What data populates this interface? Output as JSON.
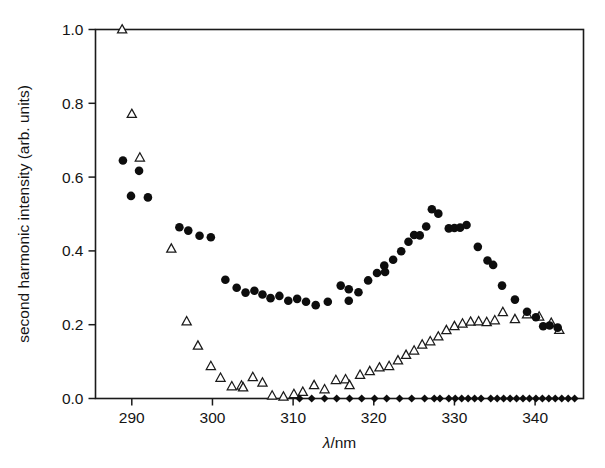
{
  "chart_data": {
    "type": "scatter",
    "title": "",
    "xlabel": "λ/nm",
    "ylabel": "second harmonic intensity (arb. units)",
    "xlim": [
      285.5,
      346
    ],
    "ylim": [
      0.0,
      1.0
    ],
    "xticks": [
      290,
      300,
      310,
      320,
      330,
      340
    ],
    "xticklabels": [
      "290",
      "300",
      "310",
      "320",
      "330",
      "340"
    ],
    "yticks": [
      0.0,
      0.2,
      0.4,
      0.6,
      0.8,
      1.0
    ],
    "yticklabels": [
      "0.0",
      "0.2",
      "0.4",
      "0.6",
      "0.8",
      "1.0"
    ],
    "grid": false,
    "legend": "none",
    "frame": "box",
    "series": [
      {
        "name": "second harmonic signal",
        "marker": "filled-circle",
        "color": "#0d0d0d",
        "points": [
          [
            288.9,
            0.645
          ],
          [
            289.9,
            0.549
          ],
          [
            290.9,
            0.617
          ],
          [
            292.0,
            0.545
          ],
          [
            295.9,
            0.464
          ],
          [
            297.0,
            0.455
          ],
          [
            298.4,
            0.441
          ],
          [
            299.8,
            0.437
          ],
          [
            301.6,
            0.322
          ],
          [
            303.0,
            0.3
          ],
          [
            304.1,
            0.287
          ],
          [
            305.2,
            0.292
          ],
          [
            306.2,
            0.282
          ],
          [
            307.2,
            0.272
          ],
          [
            308.3,
            0.278
          ],
          [
            309.4,
            0.265
          ],
          [
            310.5,
            0.27
          ],
          [
            311.6,
            0.262
          ],
          [
            312.8,
            0.253
          ],
          [
            314.3,
            0.262
          ],
          [
            315.9,
            0.306
          ],
          [
            316.9,
            0.296
          ],
          [
            316.9,
            0.265
          ],
          [
            318.1,
            0.288
          ],
          [
            319.3,
            0.32
          ],
          [
            320.4,
            0.34
          ],
          [
            321.3,
            0.36
          ],
          [
            321.4,
            0.343
          ],
          [
            322.4,
            0.376
          ],
          [
            323.4,
            0.399
          ],
          [
            324.3,
            0.425
          ],
          [
            325.0,
            0.443
          ],
          [
            325.7,
            0.442
          ],
          [
            326.5,
            0.466
          ],
          [
            327.2,
            0.513
          ],
          [
            328.0,
            0.501
          ],
          [
            329.3,
            0.461
          ],
          [
            330.0,
            0.462
          ],
          [
            330.7,
            0.463
          ],
          [
            331.5,
            0.47
          ],
          [
            332.9,
            0.411
          ],
          [
            334.1,
            0.374
          ],
          [
            334.8,
            0.362
          ],
          [
            335.9,
            0.306
          ],
          [
            337.5,
            0.268
          ],
          [
            339.0,
            0.235
          ],
          [
            340.1,
            0.22
          ],
          [
            341.0,
            0.196
          ],
          [
            341.8,
            0.198
          ],
          [
            342.8,
            0.192
          ]
        ]
      },
      {
        "name": "background / reference scan",
        "marker": "open-triangle",
        "color": "#1a1a1a",
        "points": [
          [
            288.8,
            1.0
          ],
          [
            290.0,
            0.771
          ],
          [
            291.0,
            0.653
          ],
          [
            294.9,
            0.406
          ],
          [
            296.8,
            0.209
          ],
          [
            298.2,
            0.143
          ],
          [
            299.8,
            0.088
          ],
          [
            301.0,
            0.056
          ],
          [
            302.4,
            0.033
          ],
          [
            303.6,
            0.035
          ],
          [
            303.8,
            0.03
          ],
          [
            305.0,
            0.058
          ],
          [
            306.2,
            0.043
          ],
          [
            307.4,
            0.008
          ],
          [
            308.8,
            0.005
          ],
          [
            310.1,
            0.012
          ],
          [
            311.2,
            0.018
          ],
          [
            312.6,
            0.036
          ],
          [
            313.9,
            0.025
          ],
          [
            315.3,
            0.05
          ],
          [
            316.5,
            0.052
          ],
          [
            317.0,
            0.036
          ],
          [
            318.3,
            0.064
          ],
          [
            319.5,
            0.074
          ],
          [
            320.7,
            0.084
          ],
          [
            321.9,
            0.088
          ],
          [
            323.0,
            0.103
          ],
          [
            324.0,
            0.118
          ],
          [
            325.0,
            0.13
          ],
          [
            326.0,
            0.146
          ],
          [
            327.0,
            0.155
          ],
          [
            328.0,
            0.168
          ],
          [
            329.0,
            0.185
          ],
          [
            330.0,
            0.196
          ],
          [
            331.0,
            0.203
          ],
          [
            332.0,
            0.208
          ],
          [
            333.0,
            0.209
          ],
          [
            334.0,
            0.207
          ],
          [
            335.0,
            0.212
          ],
          [
            336.0,
            0.234
          ],
          [
            337.5,
            0.215
          ],
          [
            339.0,
            0.228
          ],
          [
            340.5,
            0.222
          ],
          [
            342.0,
            0.205
          ],
          [
            343.0,
            0.186
          ]
        ]
      },
      {
        "name": "zero baseline (blocked)",
        "marker": "filled-diamond",
        "color": "#0d0d0d",
        "points": [
          [
            310.8,
            0.0
          ],
          [
            312.3,
            0.0
          ],
          [
            313.9,
            0.0
          ],
          [
            315.4,
            0.0
          ],
          [
            317.0,
            0.0
          ],
          [
            318.5,
            0.0
          ],
          [
            320.1,
            0.0
          ],
          [
            321.6,
            0.0
          ],
          [
            323.2,
            0.0
          ],
          [
            324.7,
            0.0
          ],
          [
            326.3,
            0.0
          ],
          [
            327.5,
            0.0
          ],
          [
            328.2,
            0.0
          ],
          [
            329.3,
            0.0
          ],
          [
            330.1,
            0.0
          ],
          [
            330.9,
            0.0
          ],
          [
            331.7,
            0.0
          ],
          [
            332.5,
            0.0
          ],
          [
            333.3,
            0.0
          ],
          [
            334.5,
            0.0
          ],
          [
            335.3,
            0.0
          ],
          [
            336.1,
            0.0
          ],
          [
            336.9,
            0.0
          ],
          [
            337.7,
            0.0
          ],
          [
            338.5,
            0.0
          ],
          [
            339.3,
            0.0
          ],
          [
            340.1,
            0.0
          ],
          [
            340.9,
            0.0
          ],
          [
            341.7,
            0.0
          ],
          [
            342.5,
            0.0
          ],
          [
            343.3,
            0.0
          ],
          [
            344.1,
            0.0
          ],
          [
            344.9,
            0.0
          ]
        ]
      }
    ]
  }
}
